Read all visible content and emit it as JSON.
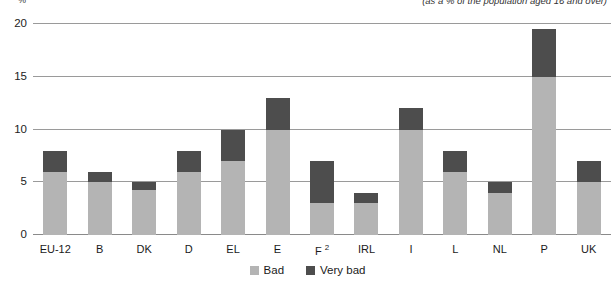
{
  "header": {
    "unit_label": "%",
    "subtitle": "(as a % of the population aged 16 and over)"
  },
  "legend": {
    "items": [
      {
        "label": "Bad",
        "color": "#b4b4b4",
        "swatch_name": "legend-swatch-bad"
      },
      {
        "label": "Very bad",
        "color": "#4d4d4d",
        "swatch_name": "legend-swatch-very-bad"
      }
    ]
  },
  "axis": {
    "y_ticks": [
      "0",
      "5",
      "10",
      "15",
      "20"
    ],
    "x_labels": [
      {
        "text": "EU-12",
        "footnote": ""
      },
      {
        "text": "B",
        "footnote": ""
      },
      {
        "text": "DK",
        "footnote": ""
      },
      {
        "text": "D",
        "footnote": ""
      },
      {
        "text": "EL",
        "footnote": ""
      },
      {
        "text": "E",
        "footnote": ""
      },
      {
        "text": "F",
        "footnote": "2"
      },
      {
        "text": "IRL",
        "footnote": ""
      },
      {
        "text": "I",
        "footnote": ""
      },
      {
        "text": "L",
        "footnote": ""
      },
      {
        "text": "NL",
        "footnote": ""
      },
      {
        "text": "P",
        "footnote": ""
      },
      {
        "text": "UK",
        "footnote": ""
      }
    ]
  },
  "chart_data": {
    "type": "bar",
    "title": "",
    "subtitle": "(as a % of the population aged 16 and over)",
    "xlabel": "",
    "ylabel": "%",
    "ylim": [
      0,
      20
    ],
    "yticks": [
      0,
      5,
      10,
      15,
      20
    ],
    "grid": true,
    "stacked": true,
    "legend_position": "bottom-center",
    "categories": [
      "EU-12",
      "B",
      "DK",
      "D",
      "EL",
      "E",
      "F",
      "IRL",
      "I",
      "L",
      "NL",
      "P",
      "UK"
    ],
    "series": [
      {
        "name": "Bad",
        "color": "#b4b4b4",
        "values": [
          6,
          5,
          4.3,
          6,
          7,
          10,
          3,
          3,
          10,
          6,
          4,
          15,
          5
        ]
      },
      {
        "name": "Very bad",
        "color": "#4d4d4d",
        "values": [
          2,
          1,
          0.7,
          2,
          3,
          3,
          4,
          1,
          2,
          2,
          1,
          4.5,
          2
        ]
      }
    ],
    "totals": [
      8,
      6,
      5,
      8,
      10,
      13,
      7,
      4,
      12,
      8,
      5,
      19.5,
      7
    ],
    "annotations": [
      {
        "target": "F",
        "marker": "2",
        "type": "footnote-superscript"
      }
    ]
  }
}
